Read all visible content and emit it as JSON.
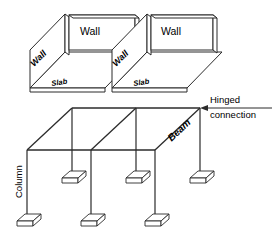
{
  "diagram": {
    "stroke_color": "#2b2b2b",
    "fill_color": "#ffffff",
    "background": "#ffffff",
    "labels": {
      "wall_back_left": "Wall",
      "wall_back_right": "Wall",
      "wall_side_left": "Wall",
      "wall_side_right": "Wall",
      "slab_left": "Slab",
      "slab_right": "Slab",
      "hinged_line1": "Hinged",
      "hinged_line2": "connection",
      "beam": "Beam",
      "column": "Column"
    },
    "components": {
      "walls_count": 4,
      "slabs_count": 2,
      "beams_label": "Beam",
      "columns_label": "Column",
      "footings_count": 7
    }
  }
}
